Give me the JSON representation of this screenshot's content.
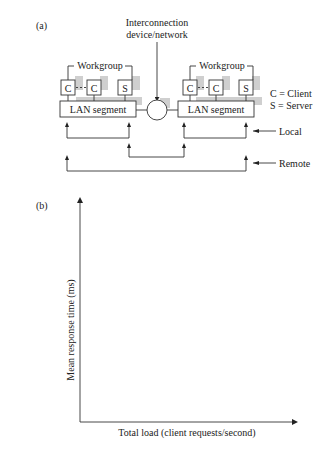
{
  "panel_a": {
    "label": "(a)",
    "interconnection_label_line1": "Interconnection",
    "interconnection_label_line2": "device/network",
    "left_group": {
      "workgroup_label": "Workgroup",
      "nodes": [
        "C",
        "C",
        "S"
      ],
      "segment_label": "LAN segment"
    },
    "right_group": {
      "workgroup_label": "Workgroup",
      "nodes": [
        "C",
        "C",
        "S"
      ],
      "segment_label": "LAN segment"
    },
    "legend": {
      "client": "C = Client",
      "server": "S = Server"
    },
    "traffic_labels": {
      "local": "Local",
      "remote": "Remote"
    }
  },
  "panel_b": {
    "label": "(b)",
    "ylabel": "Mean response time (ms)",
    "xlabel": "Total load (client requests/second)"
  }
}
